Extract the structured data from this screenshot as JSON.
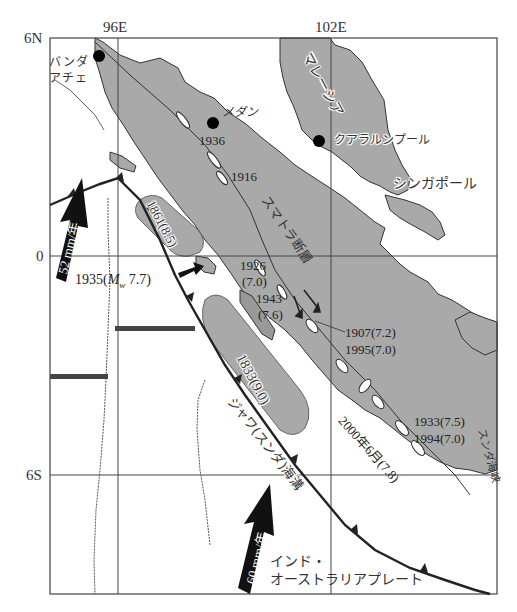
{
  "map": {
    "type": "tectonic-seismic-map",
    "region": "Sumatra and Malay Peninsula",
    "colors": {
      "land": "#a9a9a9",
      "sea": "#ffffff",
      "lines": "#333333",
      "arrow": "#111111",
      "city_dot": "#000000"
    },
    "axes": {
      "lat_labels": [
        {
          "label": "6N"
        },
        {
          "label": "0"
        },
        {
          "label": "6S"
        }
      ],
      "lon_labels": [
        {
          "label": "96E"
        },
        {
          "label": "102E"
        }
      ]
    },
    "cities": [
      {
        "name": "バンダ\nアチェ",
        "line1": "バンダ",
        "line2": "アチェ"
      },
      {
        "name": "メダン"
      },
      {
        "name": "クアラルンプール"
      },
      {
        "name": "シンガポール"
      }
    ],
    "regions": {
      "malaysia": "マレーシア",
      "fault": "スマトラ断層",
      "trench": "ジャワ(スンダ)海溝",
      "strait": "スンダ海峡",
      "plate_line1": "インド・",
      "plate_line2": "オーストラリアプレート"
    },
    "earthquakes": [
      {
        "label": "1936"
      },
      {
        "label": "1916"
      },
      {
        "label": "1861(8.5)"
      },
      {
        "label": "1935(Mw 7.7)",
        "year": "1935(",
        "m": "M",
        "sub": "w",
        "mag": " 7.7)"
      },
      {
        "label": "1926\n(7.0)",
        "line1": "1926",
        "line2": "(7.0)"
      },
      {
        "label": "1943\n(7.6)",
        "line1": "1943",
        "line2": "(7.6)"
      },
      {
        "label": "1907(7.2)"
      },
      {
        "label": "1995(7.0)"
      },
      {
        "label": "1833(9.0)"
      },
      {
        "label": "2000年6月(7.8)"
      },
      {
        "label": "1933(7.5)"
      },
      {
        "label": "1994(7.0)"
      }
    ],
    "plate_motion": [
      {
        "label": "52 mm/年"
      },
      {
        "label": "60 mm/年"
      }
    ]
  }
}
